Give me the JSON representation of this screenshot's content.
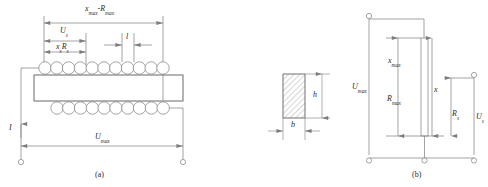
{
  "figure": {
    "caption_a": "(a)",
    "caption_b": "(b)",
    "panels": [
      {
        "id": "a",
        "name": "coil-and-core-side-view",
        "caption": "(a)",
        "labels": [
          {
            "name": "dim-xmax-rmax",
            "text": "xmax-Rmax",
            "base": "x",
            "sub": "max",
            "base2": "R",
            "sub2": "max"
          },
          {
            "name": "dim-us",
            "text": "Us",
            "base": "U",
            "sub": "s"
          },
          {
            "name": "dim-xs-rs",
            "text": "xsRs",
            "base": "x",
            "sub": "s",
            "base2": "R",
            "sub2": "s"
          },
          {
            "name": "dim-l",
            "text": "l"
          },
          {
            "name": "current-I",
            "text": "I"
          },
          {
            "name": "dim-umax",
            "text": "Umax",
            "base": "U",
            "sub": "max"
          }
        ],
        "coil_turns_top": 11,
        "coil_turns_bottom": 10
      },
      {
        "id": "cross-section",
        "name": "conductor-cross-section",
        "labels": [
          {
            "name": "dim-h",
            "text": "h"
          },
          {
            "name": "dim-b",
            "text": "b"
          }
        ],
        "hatched": true
      },
      {
        "id": "b",
        "name": "potentiometer-schematic",
        "caption": "(b)",
        "labels": [
          {
            "name": "dim-umax",
            "text": "Umax",
            "base": "U",
            "sub": "max"
          },
          {
            "name": "dim-xmax",
            "text": "xmax",
            "base": "x",
            "sub": "max"
          },
          {
            "name": "dim-rmax",
            "text": "Rmax",
            "base": "R",
            "sub": "max"
          },
          {
            "name": "dim-x",
            "text": "x"
          },
          {
            "name": "dim-rs",
            "text": "Rs",
            "base": "R",
            "sub": "s"
          },
          {
            "name": "dim-us",
            "text": "Us",
            "base": "U",
            "sub": "s"
          }
        ],
        "terminals": 3
      }
    ]
  },
  "labels": {
    "a_xmax": "x",
    "a_xmax_sub": "max",
    "a_rmax": "R",
    "a_rmax_sub": "max",
    "a_dash": "-",
    "a_us": "U",
    "a_us_sub": "s",
    "a_xs": "x",
    "a_xs_sub": "s",
    "a_rs": "R",
    "a_rs_sub": "s",
    "a_l": "l",
    "a_I": "I",
    "a_umax": "U",
    "a_umax_sub": "max",
    "cs_h": "h",
    "cs_b": "b",
    "b_umax": "U",
    "b_umax_sub": "max",
    "b_xmax": "x",
    "b_xmax_sub": "max",
    "b_rmax": "R",
    "b_rmax_sub": "max",
    "b_x": "x",
    "b_rs": "R",
    "b_rs_sub": "s",
    "b_us": "U",
    "b_us_sub": "s",
    "caption_a": "(a)",
    "caption_b": "(b)"
  },
  "colors": {
    "line": "#7d7d7d",
    "line_dark": "#555555",
    "text": "#2b2b2b",
    "hatch": "#8a8a8a",
    "background": "#ffffff"
  }
}
